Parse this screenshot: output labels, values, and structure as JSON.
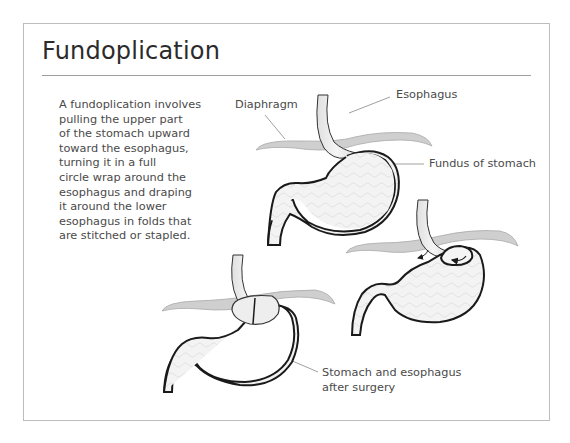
{
  "title": "Fundoplication",
  "description_lines": [
    "A fundoplication involves",
    "pulling the upper part",
    "of the stomach upward",
    "toward the esophagus,",
    "turning it in a full",
    "circle wrap around the",
    "esophagus and draping",
    "it around the lower",
    "esophagus in folds that",
    "are stitched or stapled."
  ],
  "labels": {
    "diaphragm": "Diaphragm",
    "esophagus": "Esophagus",
    "fundus": "Fundus of stomach",
    "after_line1": "Stomach and esophagus",
    "after_line2": "after surgery"
  },
  "figures": [
    {
      "name": "stomach-before",
      "caption": "Normal stomach"
    },
    {
      "name": "stomach-wrapping",
      "caption": "Fundus wrapped around esophagus"
    },
    {
      "name": "stomach-after",
      "caption": "Stomach and esophagus after surgery"
    }
  ],
  "colors": {
    "outline": "#1a1a1a",
    "diaphragm_fill": "#cfcfcf",
    "stomach_fill": "#f2f2f2",
    "border": "#bdbdbd"
  }
}
